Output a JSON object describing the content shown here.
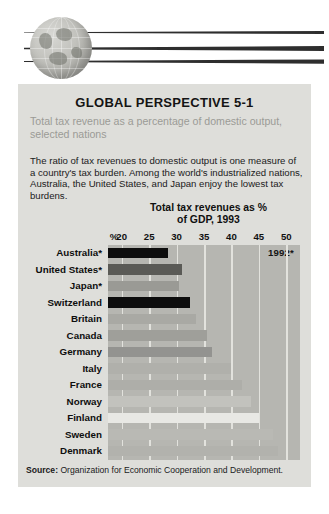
{
  "banner": {
    "globe_icon": "globe-icon",
    "streaks": 3
  },
  "card": {
    "title": "GLOBAL PERSPECTIVE 5-1",
    "subtitle": "Total tax revenue as a percentage of domestic output, selected nations",
    "body": "The ratio of tax revenues to domestic output is one measure of a country's tax burden. Among the world's industrialized nations, Australia, the United States, and Japan enjoy the lowest tax burdens."
  },
  "source": {
    "label": "Source:",
    "text": "Organization for Economic Cooperation and Development."
  },
  "chart_data": {
    "type": "bar",
    "orientation": "horizontal",
    "title": "Total tax revenues as % of GDP, 1993",
    "title_line1": "Total tax revenues as %",
    "title_line2": "of GDP, 1993",
    "annotation": "1992*",
    "xlabel": "%",
    "ylabel": "",
    "grid": true,
    "legend": "none",
    "xlim": [
      17.5,
      52.5
    ],
    "axis_unit_label": "%",
    "ticks": [
      20,
      25,
      30,
      35,
      40,
      45,
      50
    ],
    "categories": [
      "Australia*",
      "United States*",
      "Japan*",
      "Switzerland",
      "Britain",
      "Canada",
      "Germany",
      "Italy",
      "France",
      "Norway",
      "Finland",
      "Sweden",
      "Denmark"
    ],
    "values": [
      28.5,
      31.0,
      30.5,
      32.5,
      33.5,
      35.5,
      36.5,
      40.0,
      42.0,
      43.5,
      45.0,
      47.5,
      48.5
    ],
    "bar_colors": [
      "#0d0d0d",
      "#5a5a56",
      "#9a9a95",
      "#0d0d0d",
      "#a9a9a4",
      "#9f9f9a",
      "#939390",
      "#b0b0ab",
      "#aeaea9",
      "#c2c2bd",
      "#e8e8e4",
      "#b9b9b4",
      "#b2b2ad"
    ],
    "plot_bg": "#b6b6b1",
    "gridline_color": "#e2e2dd"
  }
}
